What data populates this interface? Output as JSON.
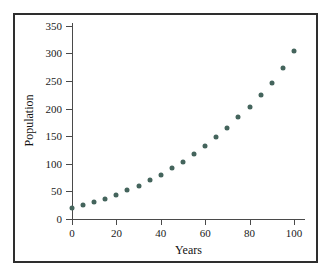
{
  "figure": {
    "background_color": "#ffffff",
    "frame_color": "#2e2e2e",
    "axis_color": "#4a4a4a",
    "marker_color": "#44645c"
  },
  "chart_data": {
    "type": "scatter",
    "title": "",
    "xlabel": "Years",
    "ylabel": "Population",
    "xlim": [
      0,
      105
    ],
    "ylim": [
      0,
      355
    ],
    "xticks": [
      0,
      20,
      40,
      60,
      80,
      100
    ],
    "xticklabels": [
      "0",
      "20",
      "40",
      "60",
      "80",
      "100"
    ],
    "yticks": [
      0,
      50,
      100,
      150,
      200,
      250,
      300,
      350
    ],
    "yticklabels": [
      "0",
      "50",
      "100",
      "150",
      "200",
      "250",
      "300",
      "350"
    ],
    "grid": false,
    "legend": false,
    "marker": "filled-circle",
    "x": [
      0,
      5,
      10,
      15,
      20,
      25,
      30,
      35,
      40,
      45,
      50,
      55,
      60,
      65,
      70,
      75,
      80,
      85,
      90,
      95,
      100
    ],
    "y": [
      20,
      25,
      31,
      37,
      44,
      52,
      60,
      70,
      80,
      92,
      104,
      118,
      133,
      148,
      165,
      184,
      203,
      224,
      247,
      274,
      305
    ],
    "series": [
      {
        "name": "Population",
        "values": [
          20,
          25,
          31,
          37,
          44,
          52,
          60,
          70,
          80,
          92,
          104,
          118,
          133,
          148,
          165,
          184,
          203,
          224,
          247,
          274,
          305
        ]
      }
    ]
  }
}
